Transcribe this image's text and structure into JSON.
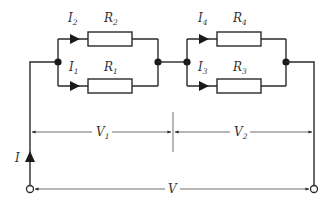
{
  "diagram": {
    "title": "",
    "colors": {
      "line": "#2a2a2a",
      "text": "#333333",
      "background": "#ffffff"
    },
    "block1": {
      "top": {
        "current": {
          "sym": "I",
          "sub": "2"
        },
        "resistor": {
          "sym": "R",
          "sub": "2"
        }
      },
      "bottom": {
        "current": {
          "sym": "I",
          "sub": "1"
        },
        "resistor": {
          "sym": "R",
          "sub": "1"
        }
      },
      "voltage": {
        "sym": "V",
        "sub": "1"
      }
    },
    "block2": {
      "top": {
        "current": {
          "sym": "I",
          "sub": "4"
        },
        "resistor": {
          "sym": "R",
          "sub": "4"
        }
      },
      "bottom": {
        "current": {
          "sym": "I",
          "sub": "3"
        },
        "resistor": {
          "sym": "R",
          "sub": "3"
        }
      },
      "voltage": {
        "sym": "V",
        "sub": "2"
      }
    },
    "total_current": {
      "sym": "I"
    },
    "total_voltage": {
      "sym": "V"
    }
  }
}
